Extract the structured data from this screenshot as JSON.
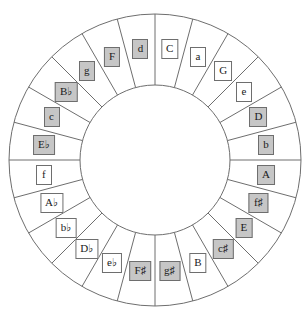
{
  "diagram": {
    "name": "circle-of-fifths",
    "type": "radial-wheel",
    "segment_count": 24,
    "geometry": {
      "center_x": 155,
      "center_y": 160,
      "outer_radius": 146,
      "inner_radius": 75,
      "label_radius": 112,
      "segment_angle_deg": 15,
      "start_offset_deg": -90
    },
    "colors": {
      "stroke": "#6e6e6e",
      "background": "#ffffff",
      "shaded_fill": "#c6c6c6",
      "unshaded_fill": "#ffffff",
      "text": "#1a1a1a"
    },
    "segments": [
      {
        "index": 0,
        "label": "C",
        "base": "C",
        "accidental": "",
        "mode": "major",
        "shaded": false
      },
      {
        "index": 1,
        "label": "a",
        "base": "a",
        "accidental": "",
        "mode": "minor",
        "shaded": false
      },
      {
        "index": 2,
        "label": "G",
        "base": "G",
        "accidental": "",
        "mode": "major",
        "shaded": false
      },
      {
        "index": 3,
        "label": "e",
        "base": "e",
        "accidental": "",
        "mode": "minor",
        "shaded": false
      },
      {
        "index": 4,
        "label": "D",
        "base": "D",
        "accidental": "",
        "mode": "major",
        "shaded": true
      },
      {
        "index": 5,
        "label": "b",
        "base": "b",
        "accidental": "",
        "mode": "minor",
        "shaded": true
      },
      {
        "index": 6,
        "label": "A",
        "base": "A",
        "accidental": "",
        "mode": "major",
        "shaded": true
      },
      {
        "index": 7,
        "label": "f♯",
        "base": "f",
        "accidental": "♯",
        "mode": "minor",
        "shaded": true
      },
      {
        "index": 8,
        "label": "E",
        "base": "E",
        "accidental": "",
        "mode": "major",
        "shaded": true
      },
      {
        "index": 9,
        "label": "c♯",
        "base": "c",
        "accidental": "♯",
        "mode": "minor",
        "shaded": true
      },
      {
        "index": 10,
        "label": "B",
        "base": "B",
        "accidental": "",
        "mode": "major",
        "shaded": false
      },
      {
        "index": 11,
        "label": "g♯",
        "base": "g",
        "accidental": "♯",
        "mode": "minor",
        "shaded": true
      },
      {
        "index": 12,
        "label": "F♯",
        "base": "F",
        "accidental": "♯",
        "mode": "major",
        "shaded": true
      },
      {
        "index": 13,
        "label": "e♭",
        "base": "e",
        "accidental": "♭",
        "mode": "minor",
        "shaded": false
      },
      {
        "index": 14,
        "label": "D♭",
        "base": "D",
        "accidental": "♭",
        "mode": "major",
        "shaded": false
      },
      {
        "index": 15,
        "label": "b♭",
        "base": "b",
        "accidental": "♭",
        "mode": "minor",
        "shaded": false
      },
      {
        "index": 16,
        "label": "A♭",
        "base": "A",
        "accidental": "♭",
        "mode": "major",
        "shaded": false
      },
      {
        "index": 17,
        "label": "f",
        "base": "f",
        "accidental": "",
        "mode": "minor",
        "shaded": false
      },
      {
        "index": 18,
        "label": "E♭",
        "base": "E",
        "accidental": "♭",
        "mode": "major",
        "shaded": true
      },
      {
        "index": 19,
        "label": "c",
        "base": "c",
        "accidental": "",
        "mode": "minor",
        "shaded": true
      },
      {
        "index": 20,
        "label": "B♭",
        "base": "B",
        "accidental": "♭",
        "mode": "major",
        "shaded": true
      },
      {
        "index": 21,
        "label": "g",
        "base": "g",
        "accidental": "",
        "mode": "minor",
        "shaded": true
      },
      {
        "index": 22,
        "label": "F",
        "base": "F",
        "accidental": "",
        "mode": "major",
        "shaded": true
      },
      {
        "index": 23,
        "label": "d",
        "base": "d",
        "accidental": "",
        "mode": "minor",
        "shaded": true
      }
    ]
  }
}
